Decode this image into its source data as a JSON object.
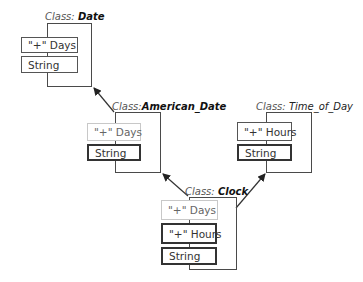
{
  "diagram": {
    "classes": [
      {
        "id": "date",
        "keyword": "Class:",
        "name": "Date",
        "fields": [
          {
            "label": "\"+\" Days",
            "kind": "own"
          },
          {
            "label": "String",
            "kind": "own"
          }
        ]
      },
      {
        "id": "american_date",
        "keyword": "Class:",
        "name": "American_Date",
        "fields": [
          {
            "label": "\"+\" Days",
            "kind": "inherited"
          },
          {
            "label": "String",
            "kind": "own-strong"
          }
        ]
      },
      {
        "id": "time_of_day",
        "keyword": "Class:",
        "name": "Time_of_Day",
        "fields": [
          {
            "label": "\"+\" Hours",
            "kind": "own"
          },
          {
            "label": "String",
            "kind": "own-strong"
          }
        ]
      },
      {
        "id": "clock",
        "keyword": "Class:",
        "name": "Clock",
        "fields": [
          {
            "label": "\"+\" Days",
            "kind": "inherited"
          },
          {
            "label": "\"+\" Hours",
            "kind": "own-strong"
          },
          {
            "label": "String",
            "kind": "own-strong"
          }
        ]
      }
    ],
    "inheritance": [
      {
        "from": "american_date",
        "to": "date"
      },
      {
        "from": "clock",
        "to": "american_date"
      },
      {
        "from": "clock",
        "to": "time_of_day"
      }
    ],
    "colors": {
      "line": "#333333",
      "inherited_border": "#c8c8c8",
      "own_border": "#333333"
    }
  }
}
